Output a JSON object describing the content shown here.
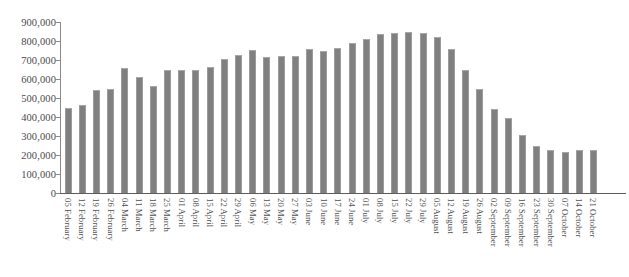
{
  "chart_data": {
    "type": "bar",
    "title": "",
    "subtitle": "",
    "xlabel": "",
    "ylabel": "",
    "ylim": [
      0,
      900000
    ],
    "grid": false,
    "legend": "none",
    "bar_color": "#808080",
    "axis_color": "#5d5d5d",
    "y_ticks": [
      "0",
      "100,000",
      "200,000",
      "300,000",
      "400,000",
      "500,000",
      "600,000",
      "700,000",
      "800,000",
      "900,000"
    ],
    "y_tick_values": [
      0,
      100000,
      200000,
      300000,
      400000,
      500000,
      600000,
      700000,
      800000,
      900000
    ],
    "categories": [
      "05 February",
      "12 February",
      "19 February",
      "26 February",
      "04 March",
      "11 March",
      "18 March",
      "25 March",
      "01 April",
      "08 April",
      "15 April",
      "22 April",
      "29 April",
      "06 May",
      "13 May",
      "20 May",
      "27 May",
      "03 June",
      "10 June",
      "17 June",
      "24 June",
      "01 July",
      "08 July",
      "15 July",
      "22 July",
      "29 July",
      "05 August",
      "12 August",
      "19 August",
      "26 August",
      "02 September",
      "09 September",
      "16 September",
      "23 September",
      "30 September",
      "07 October",
      "14 October",
      "21 October"
    ],
    "values": [
      445000,
      465000,
      540000,
      545000,
      660000,
      610000,
      565000,
      645000,
      650000,
      645000,
      665000,
      705000,
      725000,
      755000,
      715000,
      720000,
      720000,
      760000,
      745000,
      765000,
      790000,
      810000,
      835000,
      840000,
      845000,
      840000,
      820000,
      760000,
      645000,
      550000,
      440000,
      395000,
      305000,
      250000,
      225000,
      215000,
      225000,
      225000
    ]
  }
}
